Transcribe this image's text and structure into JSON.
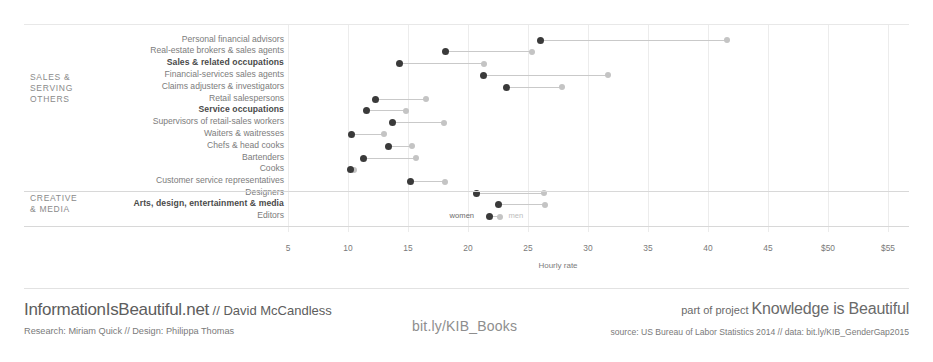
{
  "chart_data": {
    "type": "scatter",
    "subtype": "dumbbell",
    "title": "",
    "xlabel": "Hourly rate",
    "ylabel": "",
    "xlim": [
      3,
      57
    ],
    "grid": true,
    "legend_position": "inline-on-editors-row",
    "tick_labels": [
      "5",
      "10",
      "15",
      "20",
      "25",
      "30",
      "35",
      "40",
      "45",
      "$50",
      "$55"
    ],
    "tick_values": [
      5,
      10,
      15,
      20,
      25,
      30,
      35,
      40,
      45,
      50,
      55
    ],
    "series": [
      {
        "name": "women",
        "color": "#3a3a3a"
      },
      {
        "name": "men",
        "color": "#c4c4c4"
      }
    ],
    "groups": [
      {
        "caption": "SALES &\nSERVING\nOTHERS",
        "rows": [
          {
            "label": "Personal financial advisors",
            "bold": false,
            "women": 26.0,
            "men": 41.6
          },
          {
            "label": "Real-estate brokers & sales agents",
            "bold": false,
            "women": 18.1,
            "men": 25.3
          },
          {
            "label": "Sales & related occupations",
            "bold": true,
            "women": 14.3,
            "men": 21.3
          },
          {
            "label": "Financial-services sales agents",
            "bold": false,
            "women": 21.3,
            "men": 31.7
          },
          {
            "label": "Claims adjusters & investigators",
            "bold": false,
            "women": 23.2,
            "men": 27.8
          },
          {
            "label": "Retail salespersons",
            "bold": false,
            "women": 12.3,
            "men": 16.5
          },
          {
            "label": "Service occupations",
            "bold": true,
            "women": 11.5,
            "men": 14.8
          },
          {
            "label": "Supervisors of retail-sales workers",
            "bold": false,
            "women": 13.7,
            "men": 18.0
          },
          {
            "label": "Waiters & waitresses",
            "bold": false,
            "women": 10.3,
            "men": 13.0
          },
          {
            "label": "Chefs & head cooks",
            "bold": false,
            "women": 13.4,
            "men": 15.3
          },
          {
            "label": "Bartenders",
            "bold": false,
            "women": 11.3,
            "men": 15.7
          },
          {
            "label": "Cooks",
            "bold": false,
            "women": 10.2,
            "men": 10.5
          },
          {
            "label": "Customer service representatives",
            "bold": false,
            "women": 15.2,
            "men": 18.1
          }
        ]
      },
      {
        "caption": "CREATIVE\n& MEDIA",
        "rows": [
          {
            "label": "Designers",
            "bold": false,
            "women": 20.7,
            "men": 26.3
          },
          {
            "label": "Arts, design, entertainment & media",
            "bold": true,
            "women": 22.5,
            "men": 26.4
          },
          {
            "label": "Editors",
            "bold": false,
            "women": 21.8,
            "men": 22.7,
            "legend": true
          }
        ]
      }
    ]
  },
  "legend": {
    "women_label": "women",
    "men_label": "men"
  },
  "axis": {
    "title": "Hourly rate"
  },
  "footer": {
    "brand_name": "InformationIsBeautiful.net",
    "brand_sep": " // ",
    "brand_author": "David McCandless",
    "credits": "Research: Miriam Quick // Design: Philippa Thomas",
    "books_link": "bit.ly/KIB_Books",
    "project_prefix": "part of project ",
    "project_name": "Knowledge is Beautiful",
    "source": "source: US Bureau of Labor Statistics 2014 // data: bit.ly/KIB_GenderGap2015"
  },
  "colors": {
    "women_dot": "#3a3a3a",
    "men_dot": "#c4c4c4",
    "connector": "#c9c9c9",
    "gridline": "#ececec",
    "background": "#ffffff"
  }
}
